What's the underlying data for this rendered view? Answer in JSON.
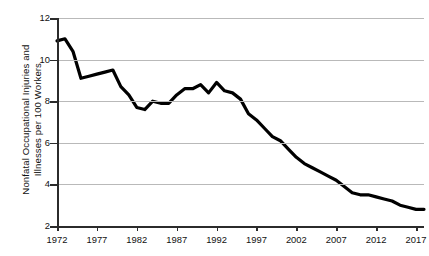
{
  "chart_data": {
    "type": "line",
    "title": "",
    "subtitle": "",
    "xlabel": "",
    "ylabel": "Nonfatal Occupational Injuries and\nIllnesses per 100 Workers",
    "ylabel_line1": "Nonfatal Occupational Injuries and",
    "ylabel_line2": "Illnesses per 100 Workers",
    "xlim": [
      1972,
      2018
    ],
    "ylim": [
      2,
      12
    ],
    "ytick_values": [
      12,
      10,
      8,
      6,
      4,
      2
    ],
    "ytick_labels": [
      "12",
      "10",
      "8",
      "6",
      "4",
      "2"
    ],
    "xtick_values": [
      1972,
      1977,
      1982,
      1987,
      1992,
      1997,
      2002,
      2007,
      2012,
      2017
    ],
    "xtick_labels": [
      "1972",
      "1977",
      "1982",
      "1987",
      "1992",
      "1997",
      "2002",
      "2007",
      "2012",
      "2017"
    ],
    "grid": "horizontal",
    "legend": "none",
    "line_color": "#000000",
    "line_width": 3.2,
    "grid_color": "#b9b9b9",
    "axis_color": "#2b2b2b",
    "background": "#ffffff",
    "x": [
      1972,
      1973,
      1974,
      1975,
      1976,
      1977,
      1978,
      1979,
      1980,
      1981,
      1982,
      1983,
      1984,
      1985,
      1986,
      1987,
      1988,
      1989,
      1990,
      1991,
      1992,
      1993,
      1994,
      1995,
      1996,
      1997,
      1998,
      1999,
      2000,
      2001,
      2002,
      2003,
      2004,
      2005,
      2006,
      2007,
      2008,
      2009,
      2010,
      2011,
      2012,
      2013,
      2014,
      2015,
      2016,
      2017,
      2018
    ],
    "values": [
      10.9,
      11.0,
      10.4,
      9.1,
      9.2,
      9.3,
      9.4,
      9.5,
      8.7,
      8.3,
      7.7,
      7.6,
      8.0,
      7.9,
      7.9,
      8.3,
      8.6,
      8.6,
      8.8,
      8.4,
      8.9,
      8.5,
      8.4,
      8.1,
      7.4,
      7.1,
      6.7,
      6.3,
      6.1,
      5.7,
      5.3,
      5.0,
      4.8,
      4.6,
      4.4,
      4.2,
      3.9,
      3.6,
      3.5,
      3.5,
      3.4,
      3.3,
      3.2,
      3.0,
      2.9,
      2.8,
      2.8
    ],
    "series": [
      {
        "name": "Nonfatal occupational injury and illness rate",
        "values": [
          10.9,
          11.0,
          10.4,
          9.1,
          9.2,
          9.3,
          9.4,
          9.5,
          8.7,
          8.3,
          7.7,
          7.6,
          8.0,
          7.9,
          7.9,
          8.3,
          8.6,
          8.6,
          8.8,
          8.4,
          8.9,
          8.5,
          8.4,
          8.1,
          7.4,
          7.1,
          6.7,
          6.3,
          6.1,
          5.7,
          5.3,
          5.0,
          4.8,
          4.6,
          4.4,
          4.2,
          3.9,
          3.6,
          3.5,
          3.5,
          3.4,
          3.3,
          3.2,
          3.0,
          2.9,
          2.8,
          2.8
        ]
      }
    ],
    "annotations": []
  }
}
